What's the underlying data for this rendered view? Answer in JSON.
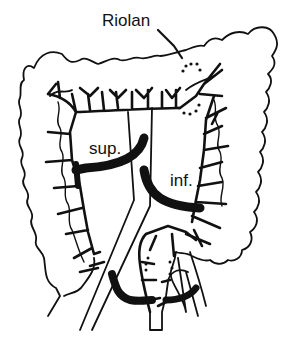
{
  "diagram": {
    "labels": {
      "riolan": "Riolan",
      "sup": "sup.",
      "inf": "inf."
    },
    "colors": {
      "ink": "#111111",
      "background": "#ffffff"
    },
    "elements": [
      {
        "name": "colon-outline",
        "description": "haustrated outline of ascending, transverse and descending colon"
      },
      {
        "name": "superior-mesenteric-artery",
        "label": "sup."
      },
      {
        "name": "inferior-mesenteric-artery",
        "label": "inf."
      },
      {
        "name": "arc-of-riolan",
        "label": "Riolan",
        "style": "dotted"
      },
      {
        "name": "marginal-artery",
        "description": "vascular arcade along colon wall"
      },
      {
        "name": "aorta",
        "description": "diagonal paired lines"
      },
      {
        "name": "sigmoid-rectum",
        "description": "lower loop"
      }
    ]
  }
}
